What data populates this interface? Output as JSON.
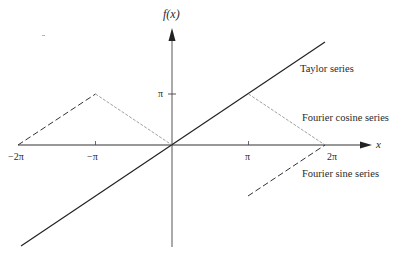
{
  "figure": {
    "y_axis_label": "f(x)",
    "x_axis_label": "x",
    "x_ticks": [
      {
        "label": "−2π",
        "value": "-2pi"
      },
      {
        "label": "−π",
        "value": "-pi"
      },
      {
        "label": "π",
        "value": "pi"
      },
      {
        "label": "2π",
        "value": "2pi"
      }
    ],
    "y_ticks": [
      {
        "label": "π",
        "value": "pi"
      }
    ],
    "curves": [
      {
        "name": "Taylor series",
        "label": "Taylor series",
        "style": "solid",
        "description": "f(x) = x, straight line through origin"
      },
      {
        "name": "Fourier cosine series",
        "label": "Fourier cosine series",
        "style": "dashed/thin",
        "description": "even extension: triangle wave with peaks at ±π of height π, zero at 0 and ±2π"
      },
      {
        "name": "Fourier sine series",
        "label": "Fourier sine series",
        "style": "dashed",
        "description": "odd extension: line x on (−π, π), then from −π at x=π rising to 0 at x=2π"
      }
    ],
    "stray_mark": "¨"
  }
}
